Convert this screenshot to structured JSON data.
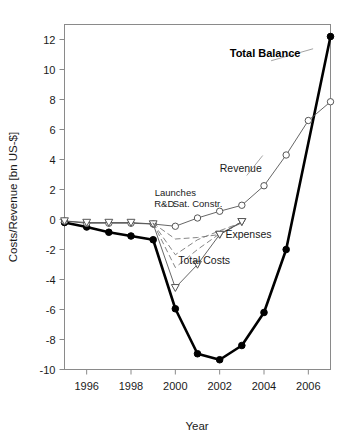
{
  "chart_data": {
    "type": "line",
    "title": "",
    "xlabel": "Year",
    "ylabel": "Costs/Revenue [bn US-$]",
    "xlim": [
      1995,
      2007
    ],
    "ylim": [
      -10,
      13
    ],
    "xticks": [
      1996,
      1998,
      2000,
      2002,
      2004,
      2006
    ],
    "xtick_labels": [
      "1996",
      "1998",
      "2000",
      "2002",
      "2004",
      "2006"
    ],
    "yticks": [
      12,
      10,
      8,
      6,
      4,
      2,
      0,
      -2,
      -4,
      -6,
      -8,
      -10
    ],
    "ytick_labels": [
      "12",
      "10",
      "8",
      "6",
      "4",
      "2",
      "0",
      "-2",
      "-4",
      "-6",
      "-8",
      "-10"
    ],
    "grid": false,
    "legend": "inline-annotations",
    "series": [
      {
        "name": "Total Balance",
        "marker": "filled-circle",
        "linestyle": "solid",
        "linewidth": 2.6,
        "color": "#000000",
        "x": [
          1995,
          1996,
          1997,
          1998,
          1999,
          2000,
          2001,
          2002,
          2003,
          2004,
          2005,
          2007
        ],
        "values": [
          -0.2,
          -0.5,
          -0.85,
          -1.1,
          -1.35,
          -5.95,
          -8.95,
          -9.35,
          -8.4,
          -6.2,
          -2.0,
          12.2
        ]
      },
      {
        "name": "Revenue",
        "marker": "open-circle",
        "linestyle": "solid",
        "linewidth": 0.9,
        "color": "#555555",
        "x": [
          1995,
          1996,
          1997,
          1998,
          1999,
          2000,
          2001,
          2002,
          2003,
          2004,
          2005,
          2006,
          2007
        ],
        "values": [
          -0.1,
          -0.25,
          -0.25,
          -0.25,
          -0.3,
          -0.45,
          0.1,
          0.55,
          0.95,
          2.25,
          4.3,
          6.6,
          7.85
        ]
      },
      {
        "name": "Total Costs",
        "marker": "open-down-triangle",
        "linestyle": "solid",
        "linewidth": 0.9,
        "color": "#555555",
        "x": [
          1995,
          1996,
          1997,
          1998,
          1999,
          2000,
          2001,
          2002,
          2003
        ],
        "values": [
          -0.1,
          -0.2,
          -0.2,
          -0.2,
          -0.3,
          -4.55,
          -3.0,
          -1.0,
          -0.15
        ]
      },
      {
        "name": "R&D",
        "marker": "none",
        "linestyle": "dashed",
        "linewidth": 0.9,
        "color": "#777777",
        "x": [
          1999,
          2000,
          2001,
          2002,
          2003
        ],
        "values": [
          -0.25,
          -2.35,
          -1.35,
          -0.75,
          -0.2
        ]
      },
      {
        "name": "Launches",
        "marker": "none",
        "linestyle": "dashed",
        "linewidth": 0.9,
        "color": "#777777",
        "x": [
          1999,
          2000,
          2001,
          2002,
          2003
        ],
        "values": [
          -0.25,
          -1.3,
          -1.2,
          -1.0,
          -0.2
        ]
      },
      {
        "name": "Sat. Constr.",
        "marker": "none",
        "linestyle": "dashed",
        "linewidth": 0.9,
        "color": "#777777",
        "x": [
          1999,
          2000,
          2001,
          2002,
          2003
        ],
        "values": [
          -0.25,
          -3.2,
          -2.0,
          -0.95,
          -0.2
        ]
      },
      {
        "name": "Expenses",
        "marker": "open-down-triangle",
        "linestyle": "solid",
        "linewidth": 0.8,
        "color": "#555555",
        "x": [
          2002,
          2003
        ],
        "values": [
          -1.0,
          -0.15
        ]
      }
    ],
    "annotations": [
      {
        "text": "Total Balance",
        "x": 2004.05,
        "y": 10.85,
        "bold": true,
        "leader": true
      },
      {
        "text": "Revenue",
        "x": 2002.95,
        "y": 3.2,
        "bold": false,
        "leader": true
      },
      {
        "text": "Expenses",
        "x": 2003.3,
        "y": -1.25,
        "bold": false,
        "leader": false
      },
      {
        "text": "Total Costs",
        "x": 2001.3,
        "y": -2.95,
        "bold": false,
        "leader": false
      },
      {
        "text": "Launches",
        "x": 2000.0,
        "y": 1.6,
        "bold": false,
        "leader": false
      },
      {
        "text": "R&D",
        "x": 1999.5,
        "y": 0.85,
        "bold": false,
        "leader": false
      },
      {
        "text": "Sat. Constr.",
        "x": 2001.0,
        "y": 0.85,
        "bold": false,
        "leader": false
      }
    ]
  },
  "axis": {
    "y_title": "Costs/Revenue [bn US-$]",
    "x_title": "Year"
  }
}
